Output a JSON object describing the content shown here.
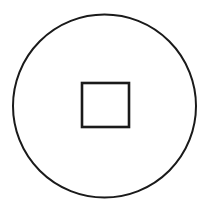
{
  "canvas": {
    "width": 210,
    "height": 208,
    "background_color": "#ffffff",
    "title": "Circle with centered square"
  },
  "figure": {
    "name": "coin-symbol",
    "stroke_color": "#1a1a1a",
    "fill_color": "#ffffff",
    "shapes": [
      {
        "name": "outer-circle",
        "type": "circle",
        "cx": 104.5,
        "cy": 106,
        "r": 91.5,
        "stroke_color": "#1a1a1a",
        "stroke_width": 2,
        "fill_color": "#ffffff"
      },
      {
        "name": "inner-square",
        "type": "rect",
        "x": 82,
        "y": 83,
        "width": 47,
        "height": 44,
        "stroke_color": "#1a1a1a",
        "stroke_width": 2.6,
        "fill_color": "#ffffff"
      }
    ]
  }
}
